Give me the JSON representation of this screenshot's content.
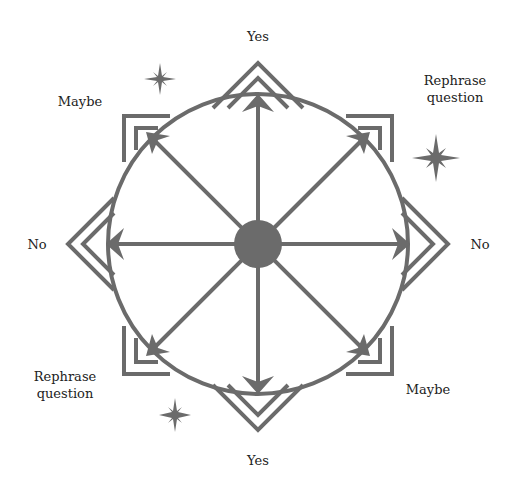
{
  "diagram": {
    "type": "pendulum-board",
    "colors": {
      "stroke": "#6b6b6b",
      "fill": "#6b6b6b",
      "text": "#222222",
      "background": "#ffffff"
    },
    "center": {
      "x": 258,
      "y": 244
    },
    "circle_radius": 150,
    "hub_radius": 24,
    "labels": {
      "top": "Yes",
      "bottom": "Yes",
      "left": "No",
      "right": "No",
      "top_left": "Maybe",
      "bottom_right": "Maybe",
      "top_right_line1": "Rephrase",
      "top_right_line2": "question",
      "bottom_left_line1": "Rephrase",
      "bottom_left_line2": "question"
    },
    "decorations": {
      "stars": [
        {
          "name": "star-top-left",
          "x": 160,
          "y": 79,
          "size": 16
        },
        {
          "name": "star-right",
          "x": 436,
          "y": 158,
          "size": 24
        },
        {
          "name": "star-bottom-left",
          "x": 175,
          "y": 415,
          "size": 16
        }
      ]
    }
  }
}
